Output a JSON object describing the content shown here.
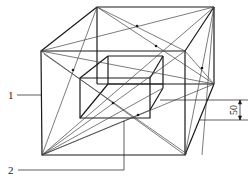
{
  "diagram": {
    "type": "technical-drawing",
    "colors": {
      "line": "#1a1a1a",
      "thin": "#444444",
      "background": "#ffffff"
    },
    "labels": [
      {
        "id": "1",
        "text": "1",
        "target": "outer-frame-front-left-edge"
      },
      {
        "id": "2",
        "text": "2",
        "target": "inner-box-bottom-intersection"
      }
    ],
    "dimensions": [
      {
        "text": "50",
        "orientation": "vertical",
        "meaning": "offset between inner box and outer frame edge"
      }
    ]
  }
}
